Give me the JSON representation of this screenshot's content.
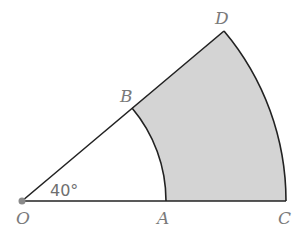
{
  "diagram": {
    "type": "annular-sector",
    "angle_label": "40°",
    "points": {
      "O": {
        "label": "O"
      },
      "A": {
        "label": "A"
      },
      "B": {
        "label": "B"
      },
      "C": {
        "label": "C"
      },
      "D": {
        "label": "D"
      }
    },
    "colors": {
      "stroke": "#222222",
      "shaded_region": "#d4d4d4",
      "label": "#7a7a7a",
      "center_dot": "#8a8a8a"
    }
  }
}
